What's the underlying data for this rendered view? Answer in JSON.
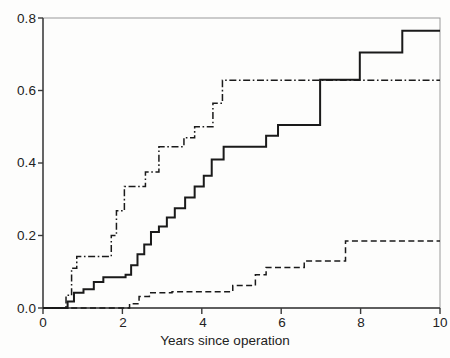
{
  "chart_data": {
    "type": "line",
    "subtype": "step",
    "title": "",
    "subtitle": "",
    "xlabel": "Years since operation",
    "ylabel": "",
    "xlim": [
      0,
      10
    ],
    "ylim": [
      0.0,
      0.8
    ],
    "xticks": [
      0,
      2,
      4,
      6,
      8,
      10
    ],
    "xtick_labels": [
      "0",
      "2",
      "4",
      "6",
      "8",
      "10"
    ],
    "yticks": [
      0.0,
      0.2,
      0.4,
      0.6,
      0.8
    ],
    "ytick_labels": [
      "0.0",
      "0.2",
      "0.4",
      "0.6",
      "0.8"
    ],
    "grid": false,
    "legend": "none",
    "legend_entries": [],
    "annotations": [],
    "series": [
      {
        "name": "solid-curve",
        "style": "solid",
        "color": "#1a1a1a",
        "x": [
          0.0,
          0.62,
          0.62,
          0.78,
          0.78,
          1.02,
          1.02,
          1.28,
          1.28,
          1.52,
          1.52,
          2.08,
          2.08,
          2.22,
          2.22,
          2.38,
          2.38,
          2.55,
          2.55,
          2.72,
          2.72,
          2.92,
          2.92,
          3.12,
          3.12,
          3.32,
          3.32,
          3.58,
          3.58,
          3.82,
          3.82,
          4.05,
          4.05,
          4.25,
          4.25,
          4.55,
          4.55,
          5.62,
          5.62,
          5.92,
          5.92,
          6.98,
          6.98,
          7.98,
          7.98,
          9.05,
          9.05,
          10.0
        ],
        "y": [
          0.0,
          0.0,
          0.018,
          0.018,
          0.042,
          0.042,
          0.052,
          0.052,
          0.072,
          0.072,
          0.085,
          0.085,
          0.092,
          0.092,
          0.118,
          0.118,
          0.148,
          0.148,
          0.175,
          0.175,
          0.21,
          0.21,
          0.225,
          0.225,
          0.25,
          0.25,
          0.275,
          0.275,
          0.305,
          0.305,
          0.335,
          0.335,
          0.365,
          0.365,
          0.41,
          0.41,
          0.445,
          0.445,
          0.475,
          0.475,
          0.505,
          0.505,
          0.63,
          0.63,
          0.705,
          0.705,
          0.765,
          0.765
        ]
      },
      {
        "name": "dash-dot-curve",
        "style": "dashdot",
        "color": "#1a1a1a",
        "x": [
          0.0,
          0.58,
          0.58,
          0.72,
          0.72,
          0.85,
          0.85,
          1.72,
          1.72,
          1.85,
          1.85,
          2.05,
          2.05,
          2.58,
          2.58,
          2.92,
          2.92,
          3.55,
          3.55,
          3.82,
          3.82,
          4.28,
          4.28,
          4.52,
          4.52,
          10.0
        ],
        "y": [
          0.0,
          0.0,
          0.035,
          0.035,
          0.11,
          0.11,
          0.142,
          0.142,
          0.2,
          0.2,
          0.268,
          0.268,
          0.335,
          0.335,
          0.375,
          0.375,
          0.445,
          0.445,
          0.47,
          0.47,
          0.5,
          0.5,
          0.565,
          0.565,
          0.628,
          0.628
        ]
      },
      {
        "name": "dashed-curve",
        "style": "dashed",
        "color": "#1a1a1a",
        "x": [
          0.0,
          2.18,
          2.18,
          2.42,
          2.42,
          2.68,
          2.68,
          3.25,
          3.25,
          4.78,
          4.78,
          5.35,
          5.35,
          5.62,
          5.62,
          6.58,
          6.58,
          7.62,
          7.62,
          10.0
        ],
        "y": [
          0.0,
          0.0,
          0.012,
          0.012,
          0.032,
          0.032,
          0.042,
          0.042,
          0.045,
          0.045,
          0.062,
          0.062,
          0.092,
          0.092,
          0.112,
          0.112,
          0.13,
          0.13,
          0.185,
          0.185
        ]
      }
    ]
  },
  "axes": {
    "y_labels": [
      "0.8",
      "0.6",
      "0.4",
      "0.2",
      "0.0"
    ],
    "x_labels": [
      "0",
      "2",
      "4",
      "6",
      "8",
      "10"
    ],
    "x_title": "Years since operation"
  },
  "colors": {
    "line": "#1a1a1a",
    "axis": "#3a3a3a",
    "frame": "#9a9a9a",
    "background": "#fdfdfc"
  }
}
